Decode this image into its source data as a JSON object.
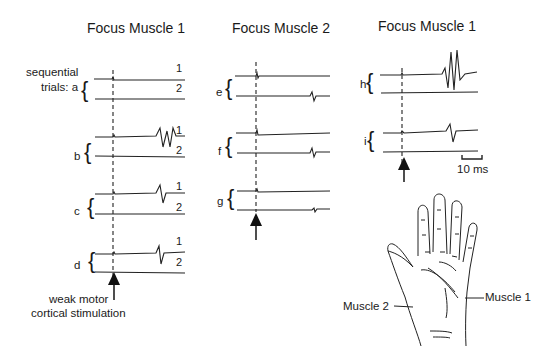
{
  "panels": [
    {
      "title": "Focus Muscle 1",
      "trials": [
        "a",
        "b",
        "c",
        "d"
      ]
    },
    {
      "title": "Focus Muscle 2",
      "trials": [
        "e",
        "f",
        "g"
      ]
    },
    {
      "title": "Focus Muscle 1",
      "trials": [
        "h",
        "i"
      ]
    }
  ],
  "labels": {
    "sequential_line1": "sequential",
    "sequential_line2": "trials: a",
    "trial_b": "b",
    "trial_c": "c",
    "trial_d": "d",
    "trial_e": "e",
    "trial_f": "f",
    "trial_g": "g",
    "trial_h": "h",
    "trial_i": "i",
    "trace1": "1",
    "trace2": "2",
    "stim_line1": "weak motor",
    "stim_line2": "cortical stimulation",
    "scale_bar": "10 ms",
    "muscle1": "Muscle 1",
    "muscle2": "Muscle 2"
  }
}
